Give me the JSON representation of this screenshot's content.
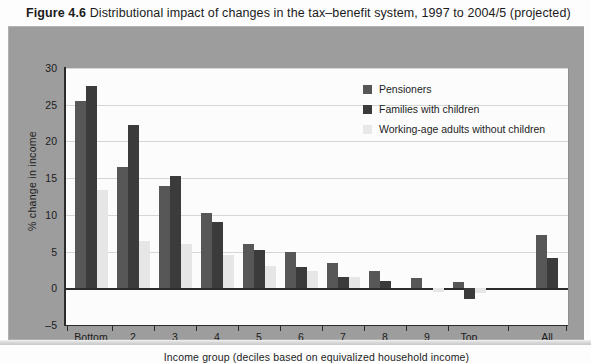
{
  "figure": {
    "number": "Figure 4.6",
    "caption": "Distributional impact of changes in the tax–benefit system, 1997 to 2004/5 (projected)"
  },
  "chart_data": {
    "type": "bar",
    "title": "Distributional impact of changes in the tax–benefit system, 1997 to 2004/5 (projected)",
    "xlabel": "Income group (deciles based on equivalized household income)",
    "ylabel": "% change in income",
    "ylim": [
      -5,
      30
    ],
    "yticks": [
      -5,
      0,
      5,
      10,
      15,
      20,
      25,
      30
    ],
    "grid": true,
    "legend_position": "top-right",
    "categories": [
      "Bottom",
      "2",
      "3",
      "4",
      "5",
      "6",
      "7",
      "8",
      "9",
      "Top",
      "All"
    ],
    "series": [
      {
        "name": "Pensioners",
        "color": "#575757",
        "values": [
          25.5,
          16.5,
          14.0,
          10.3,
          6.1,
          5.0,
          3.5,
          2.3,
          1.4,
          0.8,
          7.2
        ]
      },
      {
        "name": "Families with children",
        "color": "#3b3b3b",
        "values": [
          27.5,
          22.2,
          15.3,
          9.0,
          5.2,
          2.9,
          1.6,
          1.0,
          0.0,
          -1.5,
          4.1
        ]
      },
      {
        "name": "Working-age adults without children",
        "color": "#e6e6e6",
        "values": [
          13.4,
          6.5,
          6.0,
          4.6,
          3.0,
          2.3,
          1.5,
          0.0,
          -0.5,
          -0.6,
          null
        ]
      }
    ]
  },
  "legend": {
    "items": [
      {
        "label": "Pensioners"
      },
      {
        "label": "Families with children"
      },
      {
        "label": "Working-age adults without children"
      }
    ]
  }
}
